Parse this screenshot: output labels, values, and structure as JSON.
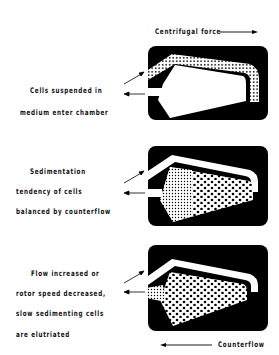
{
  "header": {
    "centrifugal_force": "Centrifugal force"
  },
  "footer": {
    "counterflow": "Counterflow"
  },
  "panels": [
    {
      "lines": [
        "Cells suspended in",
        "medium enter chamber"
      ]
    },
    {
      "lines": [
        "Sedimentation",
        "tendency of cells",
        "balanced by counterflow"
      ]
    },
    {
      "lines": [
        "Flow increased or",
        "rotor speed decreased,",
        "slow sedimenting cells",
        "are elutriated"
      ]
    }
  ],
  "colors": {
    "chamber": "#000000",
    "background": "#ffffff"
  }
}
